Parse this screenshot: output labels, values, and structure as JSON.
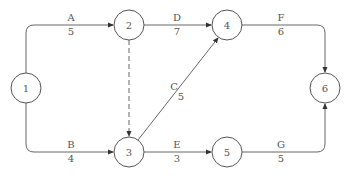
{
  "diagram": {
    "type": "activity-on-arrow network",
    "nodes": [
      {
        "id": "1",
        "label": "1"
      },
      {
        "id": "2",
        "label": "2"
      },
      {
        "id": "3",
        "label": "3"
      },
      {
        "id": "4",
        "label": "4"
      },
      {
        "id": "5",
        "label": "5"
      },
      {
        "id": "6",
        "label": "6"
      }
    ],
    "edges": [
      {
        "activity": "A",
        "duration": "5",
        "from": "1",
        "to": "2",
        "style": "solid"
      },
      {
        "activity": "B",
        "duration": "4",
        "from": "1",
        "to": "3",
        "style": "solid"
      },
      {
        "activity": "C",
        "duration": "5",
        "from": "3",
        "to": "4",
        "style": "solid"
      },
      {
        "activity": "D",
        "duration": "7",
        "from": "2",
        "to": "4",
        "style": "solid"
      },
      {
        "activity": "E",
        "duration": "3",
        "from": "3",
        "to": "5",
        "style": "solid"
      },
      {
        "activity": "F",
        "duration": "6",
        "from": "4",
        "to": "6",
        "style": "solid"
      },
      {
        "activity": "G",
        "duration": "5",
        "from": "5",
        "to": "6",
        "style": "solid"
      },
      {
        "activity": "",
        "duration": "",
        "from": "2",
        "to": "3",
        "style": "dashed",
        "note": "dummy"
      }
    ]
  }
}
